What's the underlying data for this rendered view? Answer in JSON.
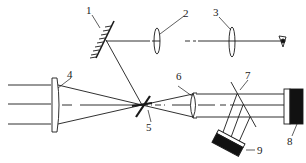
{
  "diagram": {
    "type": "optical-schematic",
    "colors": {
      "stroke": "#1a1a1a",
      "fill_dark": "#111111",
      "background": "#ffffff"
    },
    "labels": [
      {
        "id": "1",
        "text": "1",
        "component": "mirror"
      },
      {
        "id": "2",
        "text": "2",
        "component": "lens"
      },
      {
        "id": "3",
        "text": "3",
        "component": "lens"
      },
      {
        "id": "4",
        "text": "4",
        "component": "lens"
      },
      {
        "id": "5",
        "text": "5",
        "component": "focal-element"
      },
      {
        "id": "6",
        "text": "6",
        "component": "lens"
      },
      {
        "id": "7",
        "text": "7",
        "component": "beam-splitter"
      },
      {
        "id": "8",
        "text": "8",
        "component": "detector"
      },
      {
        "id": "9",
        "text": "9",
        "component": "detector"
      }
    ],
    "icons": {
      "eye": "eye-icon"
    }
  }
}
